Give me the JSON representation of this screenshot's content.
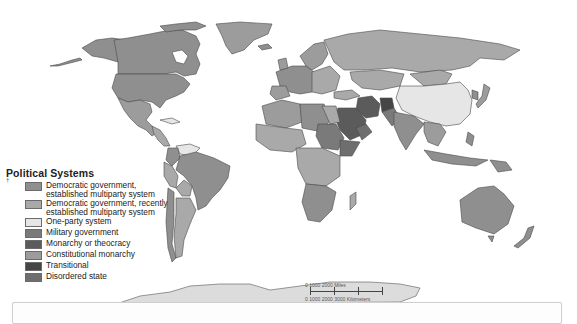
{
  "map": {
    "subject": "World political systems map",
    "background_color": "#ffffff",
    "ocean_color": "#ffffff",
    "border_color": "#4a4a4a",
    "antarctica_color": "#dcdcdc"
  },
  "legend": {
    "title": "Political Systems",
    "items": [
      {
        "label": "Democratic government,\nestablished multiparty system",
        "color": "#8f8f8f"
      },
      {
        "label": "Democratic government, recently\nestablished multiparty system",
        "color": "#a9a9a9"
      },
      {
        "label": "One-party system",
        "color": "#e6e6e6"
      },
      {
        "label": "Military government",
        "color": "#7a7a7a"
      },
      {
        "label": "Monarchy or theocracy",
        "color": "#5b5b5b"
      },
      {
        "label": "Constitutional monarchy",
        "color": "#9c9c9c"
      },
      {
        "label": "Transitional",
        "color": "#464646"
      },
      {
        "label": "Disordered state",
        "color": "#6e6e6e"
      }
    ]
  },
  "scale_bar": {
    "miles_label": "0      1000      2000 Miles",
    "km_label": "0   1000  2000  3000 Kilometers"
  },
  "side_mark": "†"
}
